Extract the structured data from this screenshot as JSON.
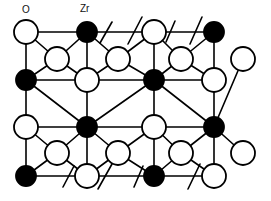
{
  "figure": {
    "type": "crystal-structure-lattice-diagram",
    "width": 271,
    "height": 201,
    "background_color": "#ffffff",
    "bond_color": "#000000",
    "bond_width": 1.6,
    "outline_color": "#000000",
    "outline_width": 1.8
  },
  "labels": [
    {
      "id": "label-o",
      "text": "O",
      "x": 22,
      "y": 5
    },
    {
      "id": "label-zr",
      "text": "Zr",
      "x": 80,
      "y": 4
    }
  ],
  "legend": {
    "oxygen": {
      "symbol": "O",
      "fill": "#ffffff",
      "stroke": "#000000",
      "radius": 12
    },
    "zirconium": {
      "symbol": "Zr",
      "fill": "#000000",
      "stroke": "#000000",
      "radius": 10
    }
  },
  "atoms": [
    {
      "id": "a1",
      "species": "O",
      "x": 26,
      "y": 32,
      "r": 12
    },
    {
      "id": "a2",
      "species": "Zr",
      "x": 87,
      "y": 32,
      "r": 10
    },
    {
      "id": "a3",
      "species": "O",
      "x": 154,
      "y": 32,
      "r": 12
    },
    {
      "id": "a4",
      "species": "Zr",
      "x": 214,
      "y": 32,
      "r": 10
    },
    {
      "id": "b1",
      "species": "O",
      "x": 57,
      "y": 59,
      "r": 12
    },
    {
      "id": "b2",
      "species": "O",
      "x": 118,
      "y": 59,
      "r": 12
    },
    {
      "id": "b3",
      "species": "O",
      "x": 181,
      "y": 59,
      "r": 12
    },
    {
      "id": "b4",
      "species": "O",
      "x": 243,
      "y": 59,
      "r": 12
    },
    {
      "id": "c1",
      "species": "Zr",
      "x": 26,
      "y": 80,
      "r": 10
    },
    {
      "id": "c2",
      "species": "O",
      "x": 87,
      "y": 80,
      "r": 12
    },
    {
      "id": "c3",
      "species": "Zr",
      "x": 154,
      "y": 80,
      "r": 10
    },
    {
      "id": "c4",
      "species": "O",
      "x": 214,
      "y": 80,
      "r": 12
    },
    {
      "id": "d1",
      "species": "O",
      "x": 26,
      "y": 127,
      "r": 12
    },
    {
      "id": "d2",
      "species": "Zr",
      "x": 87,
      "y": 127,
      "r": 10
    },
    {
      "id": "d3",
      "species": "O",
      "x": 154,
      "y": 127,
      "r": 12
    },
    {
      "id": "d4",
      "species": "Zr",
      "x": 214,
      "y": 127,
      "r": 10
    },
    {
      "id": "e1",
      "species": "O",
      "x": 57,
      "y": 153,
      "r": 12
    },
    {
      "id": "e2",
      "species": "O",
      "x": 118,
      "y": 153,
      "r": 12
    },
    {
      "id": "e3",
      "species": "O",
      "x": 181,
      "y": 153,
      "r": 12
    },
    {
      "id": "e4",
      "species": "O",
      "x": 243,
      "y": 153,
      "r": 12
    },
    {
      "id": "f1",
      "species": "Zr",
      "x": 26,
      "y": 176,
      "r": 10
    },
    {
      "id": "f2",
      "species": "O",
      "x": 87,
      "y": 176,
      "r": 12
    },
    {
      "id": "f3",
      "species": "Zr",
      "x": 154,
      "y": 176,
      "r": 10
    },
    {
      "id": "f4",
      "species": "O",
      "x": 214,
      "y": 176,
      "r": 12
    }
  ],
  "bonds": [
    [
      "a1",
      "a2"
    ],
    [
      "a2",
      "a3"
    ],
    [
      "a3",
      "a4"
    ],
    [
      "a1",
      "c1"
    ],
    [
      "a2",
      "c2"
    ],
    [
      "a3",
      "c3"
    ],
    [
      "a4",
      "c4"
    ],
    [
      "a1",
      "b1"
    ],
    [
      "a2",
      "b1"
    ],
    [
      "a2",
      "b2"
    ],
    [
      "a3",
      "b2"
    ],
    [
      "a3",
      "b3"
    ],
    [
      "a4",
      "b3"
    ],
    [
      "b1",
      "c1"
    ],
    [
      "b1",
      "c2"
    ],
    [
      "b2",
      "c2"
    ],
    [
      "b2",
      "c3"
    ],
    [
      "b3",
      "c3"
    ],
    [
      "b3",
      "c4"
    ],
    [
      "b4",
      "d4"
    ],
    [
      "c1",
      "c2"
    ],
    [
      "c2",
      "c3"
    ],
    [
      "c3",
      "c4"
    ],
    [
      "c1",
      "d1"
    ],
    [
      "c2",
      "d2"
    ],
    [
      "c3",
      "d3"
    ],
    [
      "c4",
      "d4"
    ],
    [
      "c1",
      "d2"
    ],
    [
      "c3",
      "d2"
    ],
    [
      "c3",
      "d4"
    ],
    [
      "d1",
      "d2"
    ],
    [
      "d2",
      "d3"
    ],
    [
      "d3",
      "d4"
    ],
    [
      "d1",
      "e1"
    ],
    [
      "d2",
      "e1"
    ],
    [
      "d2",
      "e2"
    ],
    [
      "d3",
      "e2"
    ],
    [
      "d3",
      "e3"
    ],
    [
      "d4",
      "e3"
    ],
    [
      "d4",
      "e4"
    ],
    [
      "e1",
      "f1"
    ],
    [
      "e1",
      "f2"
    ],
    [
      "e2",
      "f2"
    ],
    [
      "e2",
      "f3"
    ],
    [
      "e3",
      "f3"
    ],
    [
      "e3",
      "f4"
    ],
    [
      "d1",
      "f1"
    ],
    [
      "d2",
      "f2"
    ],
    [
      "d3",
      "f3"
    ],
    [
      "d4",
      "f4"
    ],
    [
      "f1",
      "f2"
    ],
    [
      "f2",
      "f3"
    ],
    [
      "f3",
      "f4"
    ]
  ],
  "dangling_bonds": [
    {
      "id": "stub-top-1",
      "x1": 112,
      "y1": 22,
      "x2": 100,
      "y2": 43
    },
    {
      "id": "stub-top-2",
      "x1": 142,
      "y1": 17,
      "x2": 128,
      "y2": 44
    },
    {
      "id": "stub-top-3",
      "x1": 175,
      "y1": 21,
      "x2": 166,
      "y2": 42
    },
    {
      "id": "stub-top-4",
      "x1": 202,
      "y1": 17,
      "x2": 190,
      "y2": 44
    },
    {
      "id": "stub-bot-1",
      "x1": 63,
      "y1": 187,
      "x2": 74,
      "y2": 166
    },
    {
      "id": "stub-bot-2",
      "x1": 98,
      "y1": 189,
      "x2": 112,
      "y2": 164
    },
    {
      "id": "stub-bot-3",
      "x1": 134,
      "y1": 187,
      "x2": 143,
      "y2": 166
    },
    {
      "id": "stub-bot-4",
      "x1": 188,
      "y1": 189,
      "x2": 200,
      "y2": 164
    }
  ],
  "chart_data": {
    "type": "diagram",
    "title": "",
    "species_counts": {
      "O": 16,
      "Zr": 8
    },
    "rows": 6,
    "columns": 4,
    "annotations": [
      "O",
      "Zr"
    ]
  }
}
